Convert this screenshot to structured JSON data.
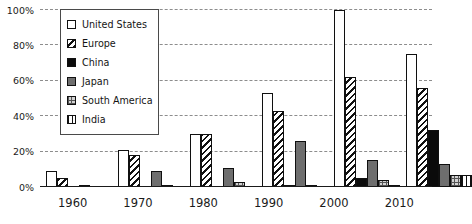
{
  "chart_data": {
    "type": "bar",
    "title": "",
    "subtitle": "",
    "xlabel": "",
    "ylabel": "",
    "categories": [
      "1960",
      "1970",
      "1980",
      "1990",
      "2000",
      "2010"
    ],
    "ylim": [
      0,
      100
    ],
    "yticks": [
      0,
      20,
      40,
      60,
      80,
      100
    ],
    "ytick_labels": [
      "0%",
      "20%",
      "40%",
      "60%",
      "80%",
      "100%"
    ],
    "y_unit": "%",
    "grid": true,
    "legend_position": "upper-left-inside",
    "series": [
      {
        "name": "United States",
        "pattern": "solid-white",
        "color": "#ffffff",
        "values": [
          9,
          21,
          30,
          53,
          100,
          75
        ]
      },
      {
        "name": "Europe",
        "pattern": "diagonal-hatch",
        "color": "#ffffff",
        "values": [
          5,
          18,
          30,
          43,
          62,
          56
        ]
      },
      {
        "name": "China",
        "pattern": "solid-black",
        "color": "#0b0b0b",
        "values": [
          0,
          0,
          0,
          1,
          5,
          32
        ]
      },
      {
        "name": "Japan",
        "pattern": "solid-gray",
        "color": "#6e6e6e",
        "values": [
          1,
          9,
          11,
          26,
          15,
          13
        ]
      },
      {
        "name": "South America",
        "pattern": "cross-hatch",
        "color": "#d2d2d2",
        "values": [
          0,
          1,
          3,
          1,
          4,
          7
        ]
      },
      {
        "name": "India",
        "pattern": "vertical-hatch",
        "color": "#ffffff",
        "values": [
          0,
          0,
          0,
          0,
          1,
          7
        ]
      }
    ]
  },
  "legend": {
    "items": [
      {
        "label": "United States",
        "swatch": "swatch-white"
      },
      {
        "label": "Europe",
        "swatch": "swatch-diagonal"
      },
      {
        "label": "China",
        "swatch": "swatch-black"
      },
      {
        "label": "Japan",
        "swatch": "swatch-gray"
      },
      {
        "label": "South America",
        "swatch": "swatch-crosshatch"
      },
      {
        "label": "India",
        "swatch": "swatch-vertical"
      }
    ]
  }
}
